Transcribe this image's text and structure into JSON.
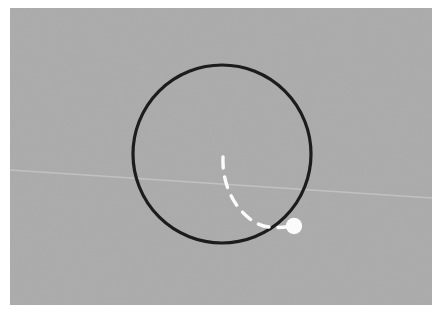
{
  "canvas": {
    "width": 439,
    "height": 323,
    "page_background": "#ffffff"
  },
  "photo": {
    "name": "gray-backdrop",
    "x": 10,
    "y": 8,
    "width": 422,
    "height": 297,
    "fill": "#ababab",
    "noise_opacity": 0.05
  },
  "faint_line": {
    "name": "faint-diagonal-streak",
    "x1": 10,
    "y1": 170,
    "x2": 432,
    "y2": 198,
    "stroke": "#c9c9c9",
    "stroke_width": 1.4,
    "opacity": 0.75
  },
  "circle": {
    "name": "black-outline-circle",
    "cx": 222,
    "cy": 154,
    "r": 89,
    "stroke": "#1c1c1c",
    "stroke_width": 3.2,
    "fill": "none"
  },
  "dot": {
    "name": "white-marker-dot",
    "cx": 294,
    "cy": 226,
    "r": 8.2,
    "fill": "#fbfbfb"
  },
  "dashed_arc": {
    "name": "white-dashed-arc",
    "description": "dashed arc sweeping from upper-left interior down to the marker dot",
    "path": "M 223 157 C 222 182, 232 205, 250 219 C 264 230, 280 228, 292 226",
    "stroke": "#fbfbfb",
    "stroke_width": 3.4,
    "dash_pattern": "11 9",
    "linecap": "round",
    "fill": "none",
    "dash_count": 6
  }
}
